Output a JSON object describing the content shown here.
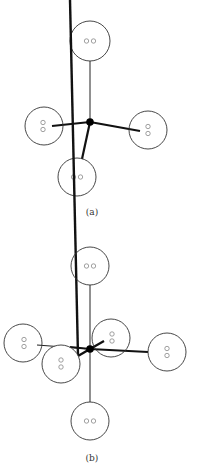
{
  "figures": [
    {
      "id": "a",
      "caption": "(a)",
      "description": "Tetrahedral arrangement: central atom with four bonded lone-pair orbitals",
      "lobes": [
        {
          "name": "top",
          "electrons": "oo",
          "orientation": "horizontal",
          "bond": "thin"
        },
        {
          "name": "left",
          "electrons": "oo",
          "orientation": "vertical",
          "bond": "thick"
        },
        {
          "name": "right",
          "electrons": "oo",
          "orientation": "vertical",
          "bond": "thick"
        },
        {
          "name": "bottom",
          "electrons": "oo",
          "orientation": "horizontal",
          "bond": "thick"
        }
      ]
    },
    {
      "id": "b",
      "caption": "(b)",
      "description": "Octahedral arrangement: central atom with six bonded lone-pair orbitals",
      "lobes": [
        {
          "name": "top",
          "electrons": "oo",
          "orientation": "horizontal",
          "bond": "thin"
        },
        {
          "name": "left",
          "electrons": "oo",
          "orientation": "vertical",
          "bond": "thin"
        },
        {
          "name": "front-left",
          "electrons": "oo",
          "orientation": "vertical",
          "bond": "thick"
        },
        {
          "name": "back-right",
          "electrons": "oo",
          "orientation": "vertical",
          "bond": "thick"
        },
        {
          "name": "right",
          "electrons": "oo",
          "orientation": "vertical",
          "bond": "thick"
        },
        {
          "name": "bottom",
          "electrons": "oo",
          "orientation": "horizontal",
          "bond": "thin"
        }
      ]
    }
  ]
}
